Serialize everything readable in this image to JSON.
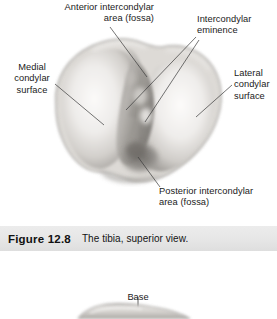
{
  "figure1": {
    "labels": {
      "anterior_intercondylar": "Anterior intercondylar\narea (fossa)",
      "intercondylar_eminence": "Intercondylar\neminence",
      "medial_condylar_surface": "Medial\ncondylar\nsurface",
      "lateral_condylar_surface": "Lateral\ncondylar\nsurface",
      "posterior_intercondylar": "Posterior intercondylar\narea (fossa)"
    },
    "caption": {
      "number": "Figure 12.8",
      "text": "The tibia, superior view."
    }
  },
  "figure2": {
    "labels": {
      "base": "Base"
    }
  },
  "colors": {
    "caption_band": "#e8e8e8",
    "text": "#1a1a1a",
    "leader_line": "#3a3a3a",
    "bone_light": "#f2f0ee",
    "bone_mid": "#c9c6c2",
    "bone_shadow": "#8d8a86"
  }
}
